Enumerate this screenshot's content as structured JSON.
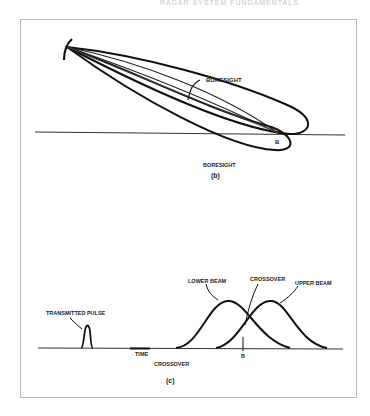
{
  "header": {
    "running_title": "RADAR SYSTEM FUNDAMENTALS"
  },
  "figure_b": {
    "caption": "(b)",
    "boresight_label": "BORESIGHT",
    "axis_label": "BORESIGHT",
    "point_label": "B"
  },
  "figure_c": {
    "caption": "(c)",
    "transmitted_pulse_label": "TRANSMITTED PULSE",
    "lower_beam_label": "LOWER BEAM",
    "upper_beam_label": "UPPER BEAM",
    "crossover_label": "CROSSOVER",
    "time_label": "TIME",
    "crossover_axis_label": "CROSSOVER",
    "point_label": "B"
  },
  "colors": {
    "ink": "#111111",
    "frame": "#b8b8b8",
    "thin_line": "#555555"
  }
}
